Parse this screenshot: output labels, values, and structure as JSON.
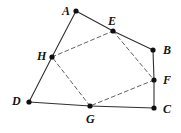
{
  "figure": {
    "type": "geometry-diagram",
    "width": 181,
    "height": 133,
    "background_color": "#ffffff",
    "stroke_color": "#303030",
    "dashed_stroke_color": "#585858",
    "point_color": "#101010",
    "point_radius": 2.6,
    "solid_stroke_width": 1.1,
    "dashed_stroke_width": 0.95,
    "dash_pattern": "4,3"
  },
  "points": [
    {
      "id": "A",
      "label": "A",
      "x": 76,
      "y": 11,
      "label_x": 62,
      "label_y": 5,
      "on_segment": ""
    },
    {
      "id": "B",
      "label": "B",
      "x": 153,
      "y": 50,
      "label_x": 163,
      "label_y": 44,
      "on_segment": ""
    },
    {
      "id": "C",
      "label": "C",
      "x": 154,
      "y": 108,
      "label_x": 163,
      "label_y": 103,
      "on_segment": ""
    },
    {
      "id": "D",
      "label": "D",
      "x": 29,
      "y": 102,
      "label_x": 12,
      "label_y": 95,
      "on_segment": ""
    },
    {
      "id": "E",
      "label": "E",
      "x": 113,
      "y": 31,
      "label_x": 108,
      "label_y": 15,
      "on_segment": "AB"
    },
    {
      "id": "F",
      "label": "F",
      "x": 154,
      "y": 80,
      "label_x": 163,
      "label_y": 74,
      "on_segment": "BC"
    },
    {
      "id": "G",
      "label": "G",
      "x": 90,
      "y": 106,
      "label_x": 86,
      "label_y": 113,
      "on_segment": "CD"
    },
    {
      "id": "H",
      "label": "H",
      "x": 52,
      "y": 57,
      "label_x": 37,
      "label_y": 50,
      "on_segment": "DA"
    }
  ],
  "solid_edges": [
    {
      "id": "edge-A-E",
      "from": "A",
      "to": "E"
    },
    {
      "id": "edge-E-B",
      "from": "E",
      "to": "B"
    },
    {
      "id": "edge-B-F",
      "from": "B",
      "to": "F"
    },
    {
      "id": "edge-F-C",
      "from": "F",
      "to": "C"
    },
    {
      "id": "edge-C-G",
      "from": "C",
      "to": "G"
    },
    {
      "id": "edge-G-D",
      "from": "G",
      "to": "D"
    },
    {
      "id": "edge-D-H",
      "from": "D",
      "to": "H"
    },
    {
      "id": "edge-H-A",
      "from": "H",
      "to": "A"
    }
  ],
  "dashed_edges": [
    {
      "id": "edge-H-E",
      "from": "H",
      "to": "E"
    },
    {
      "id": "edge-E-F",
      "from": "E",
      "to": "F"
    },
    {
      "id": "edge-F-G",
      "from": "F",
      "to": "G"
    },
    {
      "id": "edge-G-H",
      "from": "G",
      "to": "H"
    }
  ]
}
